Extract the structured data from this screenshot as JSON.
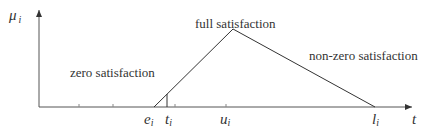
{
  "diagram": {
    "y_axis_label": "μ",
    "y_axis_sub": "i",
    "x_axis_label": "t",
    "regions": {
      "zero": "zero satisfaction",
      "full": "full satisfaction",
      "nonzero": "non-zero satisfaction"
    },
    "points": [
      {
        "sym": "e",
        "sub": "i"
      },
      {
        "sym": "t",
        "sub": "i"
      },
      {
        "sym": "u",
        "sub": "i"
      },
      {
        "sym": "l",
        "sub": "i"
      }
    ],
    "colors": {
      "line": "#333333",
      "axis": "#555555",
      "text": "#333333"
    }
  }
}
